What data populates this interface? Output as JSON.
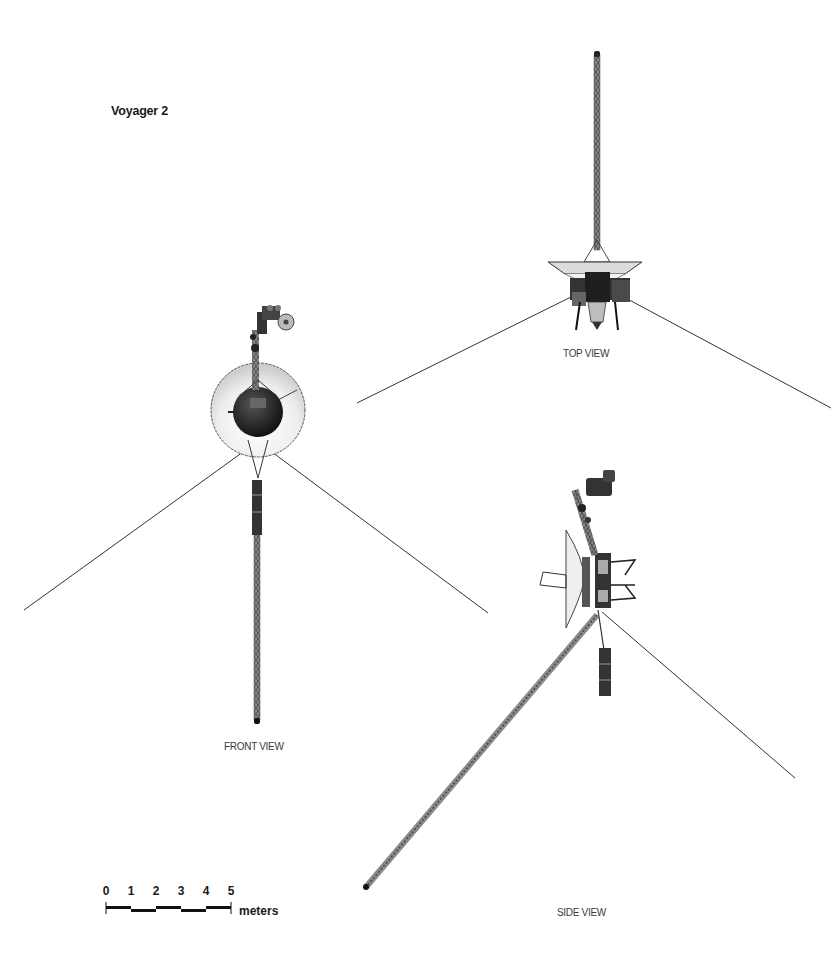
{
  "title": "Voyager 2",
  "views": {
    "top": {
      "label": "TOP VIEW"
    },
    "front": {
      "label": "FRONT VIEW"
    },
    "side": {
      "label": "SIDE VIEW"
    }
  },
  "scale_bar": {
    "ticks": [
      "0",
      "1",
      "2",
      "3",
      "4",
      "5"
    ],
    "unit": "meters"
  },
  "colors": {
    "background": "#ffffff",
    "ink": "#1a1a1a",
    "structure_dark": "#2b2b2b",
    "structure_mid": "#7a7a7a",
    "dish_light": "#e8e8e8"
  }
}
